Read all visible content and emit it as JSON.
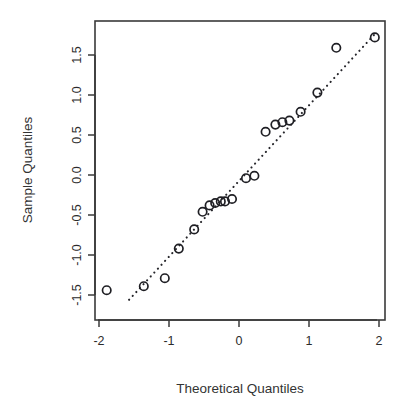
{
  "chart_data": {
    "type": "scatter",
    "title": "",
    "subtitle": "",
    "xlabel": "Theoretical Quantiles",
    "ylabel": "Sample Quantiles",
    "xlim": [
      -2.15,
      2.12
    ],
    "ylim": [
      -1.62,
      1.84
    ],
    "xticks": [
      -2,
      -1,
      0,
      1,
      2
    ],
    "xtick_labels": [
      "-2",
      "-1",
      "0",
      "1",
      "2"
    ],
    "yticks": [
      -1.5,
      -1.0,
      -0.5,
      0.0,
      0.5,
      1.0,
      1.5
    ],
    "ytick_labels": [
      "-1.5",
      "-1.0",
      "-0.5",
      "0.0",
      "0.5",
      "1.0",
      "1.5"
    ],
    "grid": false,
    "legend": null,
    "marker": "open-circle",
    "point_color": "#1f1f24",
    "line_color": "#26262b",
    "line_style": "dotted",
    "reference_line": {
      "name": "qq-line",
      "x_start": -1.57,
      "y_start": -1.56,
      "x_end": 1.96,
      "y_end": 1.78
    },
    "x": [
      -1.89,
      -1.36,
      -1.06,
      -0.86,
      -0.64,
      -0.52,
      -0.42,
      -0.34,
      -0.26,
      -0.2,
      -0.1,
      0.1,
      0.22,
      0.38,
      0.52,
      0.62,
      0.72,
      0.88,
      1.12,
      1.39,
      1.94
    ],
    "y": [
      -1.44,
      -1.39,
      -1.29,
      -0.92,
      -0.68,
      -0.46,
      -0.38,
      -0.35,
      -0.33,
      -0.33,
      -0.3,
      -0.04,
      -0.01,
      0.54,
      0.63,
      0.66,
      0.68,
      0.79,
      1.03,
      1.59,
      1.72
    ],
    "points": [
      {
        "x": -1.89,
        "y": -1.44
      },
      {
        "x": -1.36,
        "y": -1.39
      },
      {
        "x": -1.06,
        "y": -1.29
      },
      {
        "x": -0.86,
        "y": -0.92
      },
      {
        "x": -0.64,
        "y": -0.68
      },
      {
        "x": -0.52,
        "y": -0.46
      },
      {
        "x": -0.42,
        "y": -0.38
      },
      {
        "x": -0.34,
        "y": -0.35
      },
      {
        "x": -0.26,
        "y": -0.33
      },
      {
        "x": -0.2,
        "y": -0.33
      },
      {
        "x": -0.1,
        "y": -0.3
      },
      {
        "x": 0.1,
        "y": -0.04
      },
      {
        "x": 0.22,
        "y": -0.01
      },
      {
        "x": 0.38,
        "y": 0.54
      },
      {
        "x": 0.52,
        "y": 0.63
      },
      {
        "x": 0.62,
        "y": 0.66
      },
      {
        "x": 0.72,
        "y": 0.68
      },
      {
        "x": 0.88,
        "y": 0.79
      },
      {
        "x": 1.12,
        "y": 1.03
      },
      {
        "x": 1.39,
        "y": 1.59
      },
      {
        "x": 1.94,
        "y": 1.72
      }
    ]
  }
}
